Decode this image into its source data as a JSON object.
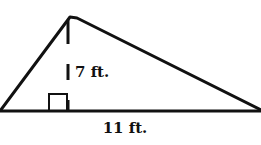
{
  "figure": {
    "type": "triangle",
    "colors": {
      "stroke": "#111111",
      "background": "#ffffff"
    },
    "height_label": "7 ft.",
    "base_label": "11 ft."
  }
}
